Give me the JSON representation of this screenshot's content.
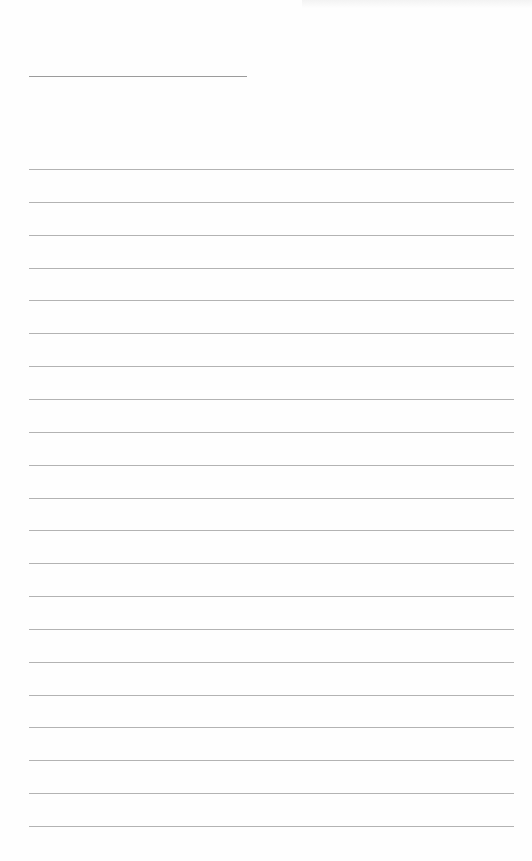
{
  "document": {
    "type": "blank-lined-sheet",
    "title_line": {
      "left": 29,
      "top": 76,
      "width": 218
    },
    "writing_lines": {
      "count": 21,
      "first_top": 169,
      "spacing": 32.85,
      "left": 29,
      "width": 485
    },
    "colors": {
      "background": "#fefefe",
      "line": "#9a9a9a",
      "title_line": "#8a8a8a"
    }
  }
}
